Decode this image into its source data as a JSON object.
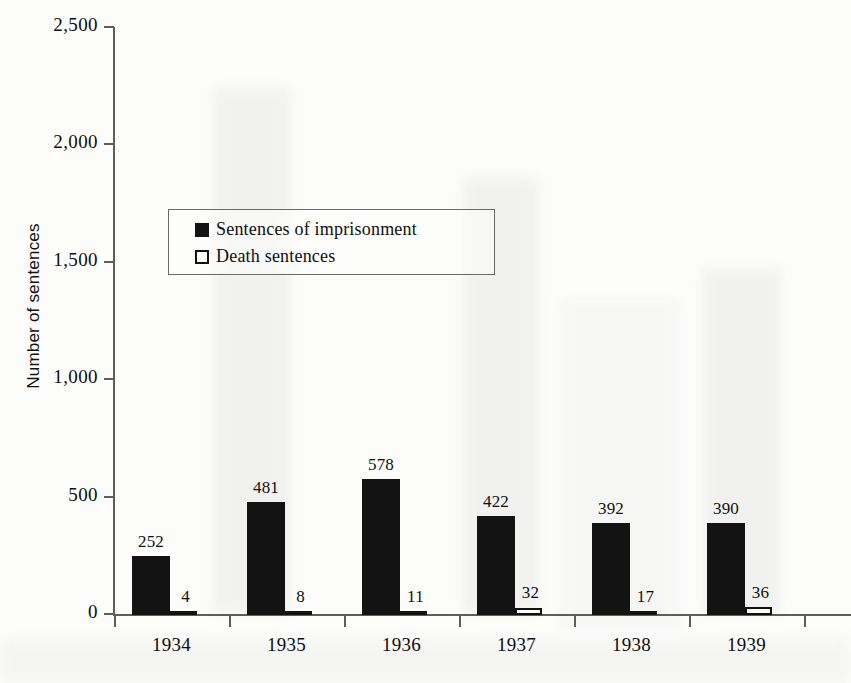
{
  "chart_data": {
    "type": "bar",
    "title": "",
    "xlabel": "",
    "ylabel": "Number of sentences",
    "categories": [
      "1934",
      "1935",
      "1936",
      "1937",
      "1938",
      "1939"
    ],
    "series": [
      {
        "name": "Sentences of imprisonment",
        "values": [
          252,
          481,
          578,
          422,
          392,
          390
        ],
        "color": "#131313",
        "style": "filled"
      },
      {
        "name": "Death sentences",
        "values": [
          4,
          8,
          11,
          32,
          17,
          36
        ],
        "color": "#ffffff",
        "style": "outlined"
      }
    ],
    "ylim": [
      0,
      2500
    ],
    "yticks": [
      0,
      500,
      1000,
      1500,
      2000,
      2500
    ],
    "ytick_labels": [
      "0",
      "500",
      "1,000",
      "1,500",
      "2,000",
      "2,500"
    ],
    "grid": false,
    "legend_position": "upper-left-inside",
    "data_labels": true
  },
  "axis": {
    "y_title": "Number of sentences",
    "ticks": [
      {
        "label": "2,500",
        "value": 2500
      },
      {
        "label": "2,000",
        "value": 2000
      },
      {
        "label": "1,500",
        "value": 1500
      },
      {
        "label": "1,000",
        "value": 1000
      },
      {
        "label": "500",
        "value": 500
      },
      {
        "label": "0",
        "value": 0
      }
    ],
    "categories": [
      "1934",
      "1935",
      "1936",
      "1937",
      "1938",
      "1939"
    ]
  },
  "legend": {
    "items": [
      {
        "label": "Sentences of imprisonment",
        "swatch": "filled-square-icon"
      },
      {
        "label": "Death sentences",
        "swatch": "open-square-icon"
      }
    ]
  },
  "groups": [
    {
      "year": "1934",
      "prison": 252,
      "death": 4,
      "prison_label": "252",
      "death_label": "4"
    },
    {
      "year": "1935",
      "prison": 481,
      "death": 8,
      "prison_label": "481",
      "death_label": "8"
    },
    {
      "year": "1936",
      "prison": 578,
      "death": 11,
      "prison_label": "578",
      "death_label": "11"
    },
    {
      "year": "1937",
      "prison": 422,
      "death": 32,
      "prison_label": "422",
      "death_label": "32"
    },
    {
      "year": "1938",
      "prison": 392,
      "death": 17,
      "prison_label": "392",
      "death_label": "17"
    },
    {
      "year": "1939",
      "prison": 390,
      "death": 36,
      "prison_label": "390",
      "death_label": "36"
    }
  ],
  "colors": {
    "prison_bar": "#131313",
    "death_bar": "#ffffff",
    "death_bar_border": "#111111",
    "axis": "#5d5d5d",
    "text": "#101010",
    "background": "#fcfcfb"
  }
}
